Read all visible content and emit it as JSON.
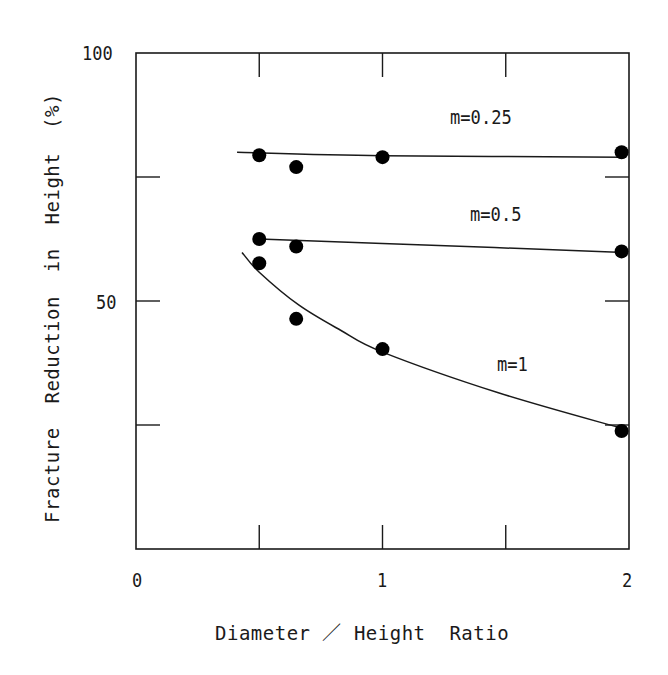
{
  "chart_data": {
    "type": "line",
    "title": "",
    "xlabel": "Diameter  /  Height  Ratio",
    "ylabel": "Fracture  Reduction  in  Height  (%)",
    "xlim": [
      0,
      2
    ],
    "ylim": [
      0,
      100
    ],
    "x_ticks": [
      0,
      0.5,
      1,
      1.5,
      2
    ],
    "x_tick_labels": [
      "0",
      "1",
      "2"
    ],
    "y_ticks": [
      0,
      25,
      50,
      75,
      100
    ],
    "y_tick_labels": [
      "50",
      "100"
    ],
    "grid": false,
    "legend": "inline labels",
    "series": [
      {
        "name": "m=0.25",
        "points": [
          [
            0.5,
            79.4
          ],
          [
            0.65,
            77.0
          ],
          [
            1.0,
            79.0
          ],
          [
            1.97,
            80.0
          ]
        ],
        "fit_curve": [
          [
            0.41,
            80.0
          ],
          [
            1.0,
            79.3
          ],
          [
            1.98,
            79.0
          ]
        ]
      },
      {
        "name": "m=0.5",
        "points": [
          [
            0.5,
            62.5
          ],
          [
            0.65,
            61.0
          ],
          [
            1.97,
            60.0
          ]
        ],
        "fit_curve": [
          [
            0.5,
            62.5
          ],
          [
            1.0,
            61.6
          ],
          [
            1.98,
            59.8
          ]
        ]
      },
      {
        "name": "m=1",
        "points": [
          [
            0.5,
            57.6
          ],
          [
            0.65,
            46.4
          ],
          [
            1.0,
            40.3
          ],
          [
            1.97,
            23.8
          ]
        ],
        "fit_curve": [
          [
            0.43,
            59.8
          ],
          [
            0.5,
            55.8
          ],
          [
            0.66,
            49.2
          ],
          [
            0.83,
            44.1
          ],
          [
            1.0,
            39.7
          ],
          [
            1.47,
            31.5
          ],
          [
            1.98,
            24.2
          ]
        ]
      }
    ]
  },
  "labels": {
    "x_title": "Diameter ／ Height  Ratio",
    "y_title": "Fracture  Reduction  in  Height  (%)",
    "x0": "0",
    "x1": "1",
    "x2": "2",
    "y50": "50",
    "y100": "100",
    "m025": "m=0.25",
    "m05": "m=0.5",
    "m1": "m=1"
  }
}
